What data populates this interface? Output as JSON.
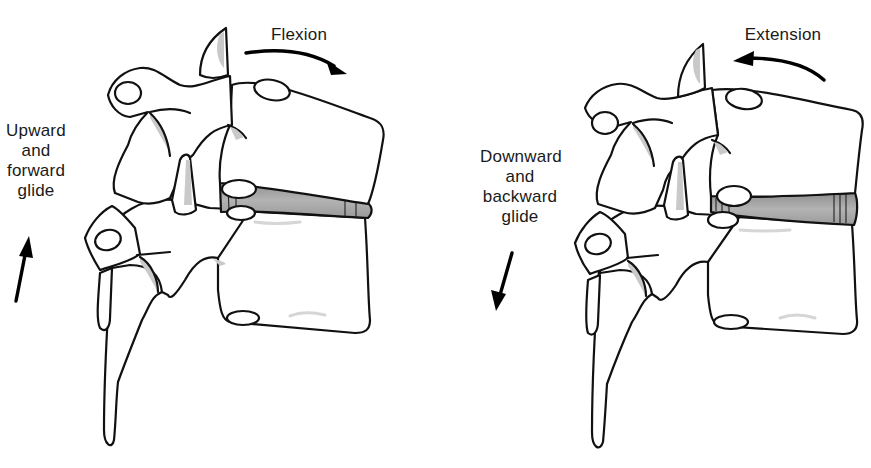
{
  "figure": {
    "type": "anatomical-diagram",
    "panels": [
      {
        "id": "flexion",
        "motion_label": "Flexion",
        "motion_arrow_direction": "clockwise (forward)",
        "glide_label_lines": [
          "Upward",
          "and",
          "forward",
          "glide"
        ],
        "glide_arrow_direction": "up",
        "disc_wedge": "compressed anteriorly (right side narrower)"
      },
      {
        "id": "extension",
        "motion_label": "Extension",
        "motion_arrow_direction": "counter-clockwise (backward)",
        "glide_label_lines": [
          "Downward",
          "and",
          "backward",
          "glide"
        ],
        "glide_arrow_direction": "down",
        "disc_wedge": "compressed posteriorly (left side narrower)"
      }
    ],
    "colors": {
      "outline": "#111111",
      "disc_fill": "#a8a8a8",
      "shading": "#c9c9c9",
      "background": "#ffffff"
    }
  }
}
